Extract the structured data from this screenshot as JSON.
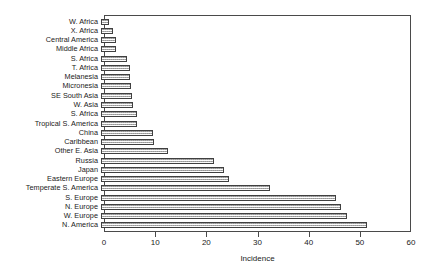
{
  "chart_data": {
    "type": "bar",
    "orientation": "horizontal",
    "title": "",
    "xlabel": "Incidence",
    "ylabel": "",
    "xlim": [
      0,
      60
    ],
    "xticks": [
      0,
      10,
      20,
      30,
      40,
      50,
      60
    ],
    "xtick_labels": [
      "0",
      "10",
      "20",
      "30",
      "40",
      "50",
      "60"
    ],
    "grid": false,
    "legend": null,
    "bar_style": {
      "fill": "#d2d2d2",
      "pattern": "stippled-gray",
      "border": "#404040"
    },
    "categories": [
      "W. Africa",
      "X. Africa",
      "Central America",
      "Middle Africa",
      "S. Africa",
      "T. Africa",
      "Melanesia",
      "Micronesia",
      "SE South Asia",
      "W. Asia",
      "S. Africa",
      "Tropical S. America",
      "China",
      "Caribbean",
      "Other E. Asia",
      "Russia",
      "Japan",
      "Eastern Europe",
      "Temperate S. America",
      "S. Europe",
      "N. Europe",
      "W. Europe",
      "N. America"
    ],
    "values": [
      1.5,
      2.3,
      3.0,
      3.0,
      5.0,
      5.6,
      5.7,
      5.9,
      6.0,
      6.2,
      7.0,
      7.1,
      10.2,
      10.3,
      13.0,
      22.0,
      24.0,
      25.0,
      33.0,
      46.0,
      47.0,
      48.0,
      52.0
    ]
  }
}
